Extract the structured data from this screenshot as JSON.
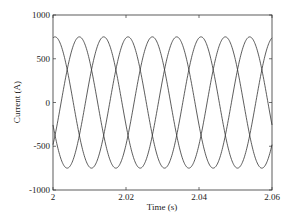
{
  "chart_data": {
    "type": "line",
    "title": "",
    "xlabel": "Time (s)",
    "ylabel": "Current (A)",
    "xlim": [
      2,
      2.06
    ],
    "ylim": [
      -1000,
      1000
    ],
    "xticks": [
      2,
      2.02,
      2.04,
      2.06
    ],
    "xtick_labels": [
      "2",
      "2.02",
      "2.04",
      "2.06"
    ],
    "yticks": [
      1000,
      500,
      0,
      -500,
      -1000
    ],
    "ytick_labels": [
      "1000",
      "500",
      "0",
      "-500",
      "-1000"
    ],
    "grid": false,
    "legend": null,
    "series": [
      {
        "name": "Phase A",
        "amplitude": 750,
        "frequency_hz": 50,
        "phase_deg": 80,
        "color": "#333333"
      },
      {
        "name": "Phase B",
        "amplitude": 750,
        "frequency_hz": 50,
        "phase_deg": 200,
        "color": "#333333"
      },
      {
        "name": "Phase C",
        "amplitude": 750,
        "frequency_hz": 50,
        "phase_deg": -40,
        "color": "#333333"
      }
    ]
  }
}
